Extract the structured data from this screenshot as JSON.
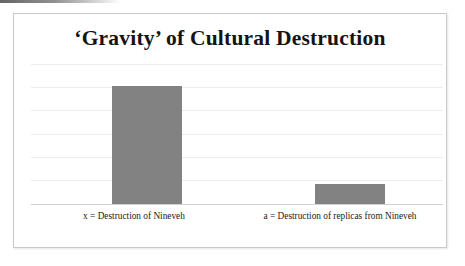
{
  "chart_data": {
    "type": "bar",
    "title": "‘Gravity’ of Cultural Destruction",
    "categories": [
      "x = Destruction of Nineveh",
      "a = Destruction of replicas from Nineveh"
    ],
    "values": [
      0.84,
      0.14
    ],
    "xlabel": "",
    "ylabel": "",
    "ylim": [
      0,
      1
    ],
    "grid": true,
    "gridlines": 7,
    "legend": "none",
    "tick_labels": [],
    "bar_color": "#828282",
    "background_color": "#ffffff",
    "gridline_color": "#ededed",
    "axis_color": "#d2d2d2",
    "frame_color": "#c9c9c9",
    "title_color": "#141414"
  },
  "labels": {
    "bar_one": "x = Destruction of Nineveh",
    "bar_two": "a = Destruction of replicas from Nineveh"
  }
}
